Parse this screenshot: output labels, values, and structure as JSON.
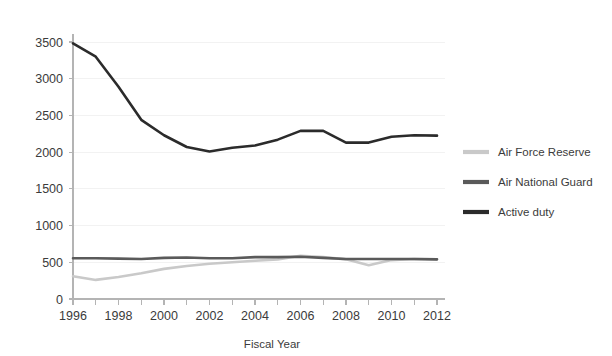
{
  "chart_data": {
    "type": "line",
    "title": "",
    "subtitle": "",
    "xlabel": "Fiscal Year",
    "ylabel": "",
    "grid": true,
    "legend_position": "right",
    "xlim": [
      1996,
      2012
    ],
    "ylim": [
      0,
      3500
    ],
    "x": [
      1996,
      1997,
      1998,
      1999,
      2000,
      2001,
      2002,
      2003,
      2004,
      2005,
      2006,
      2007,
      2008,
      2009,
      2010,
      2011,
      2012
    ],
    "xtick_labels": [
      "1996",
      "1998",
      "2000",
      "2002",
      "2004",
      "2006",
      "2008",
      "2010",
      "2012"
    ],
    "xtick_values": [
      1996,
      1998,
      2000,
      2002,
      2004,
      2006,
      2008,
      2010,
      2012
    ],
    "ytick_labels": [
      "0",
      "500",
      "1000",
      "1500",
      "2000",
      "2500",
      "3000",
      "3500"
    ],
    "ytick_values": [
      0,
      500,
      1000,
      1500,
      2000,
      2500,
      3000,
      3500
    ],
    "series": [
      {
        "name": "Air Force Reserve",
        "color": "#c9c9c9",
        "values": [
          310,
          260,
          300,
          350,
          410,
          450,
          480,
          500,
          520,
          540,
          590,
          570,
          540,
          460,
          530,
          545,
          540
        ]
      },
      {
        "name": "Air National Guard",
        "color": "#5a5a5a",
        "values": [
          555,
          555,
          550,
          545,
          560,
          565,
          555,
          555,
          570,
          570,
          575,
          560,
          545,
          545,
          545,
          545,
          540
        ]
      },
      {
        "name": "Active duty",
        "color": "#2b2b2b",
        "values": [
          3480,
          3300,
          2890,
          2440,
          2230,
          2070,
          2010,
          2060,
          2090,
          2170,
          2290,
          2290,
          2130,
          2130,
          2210,
          2230,
          2225
        ]
      }
    ]
  },
  "legend": {
    "items": [
      {
        "label": "Air Force Reserve",
        "color": "#c9c9c9"
      },
      {
        "label": "Air National Guard",
        "color": "#5a5a5a"
      },
      {
        "label": "Active duty",
        "color": "#2b2b2b"
      }
    ]
  }
}
